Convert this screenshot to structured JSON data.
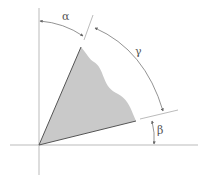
{
  "diagram": {
    "labels": {
      "alpha": "α",
      "gamma": "γ",
      "beta": "β"
    },
    "colors": {
      "axis": "#b8b8b8",
      "shape_fill": "#c9c9c9",
      "shape_edge": "#555555",
      "arc": "#777777",
      "label": "#555555"
    },
    "axes": {
      "origin": [
        39,
        145
      ],
      "vertical": {
        "x": 39,
        "y1": 8,
        "y2": 175
      },
      "horizontal": {
        "y": 145,
        "x1": 10,
        "x2": 198
      }
    },
    "shape": {
      "apex": [
        81,
        47
      ],
      "right_vertex": [
        136,
        121
      ],
      "origin": [
        39,
        145
      ]
    }
  }
}
